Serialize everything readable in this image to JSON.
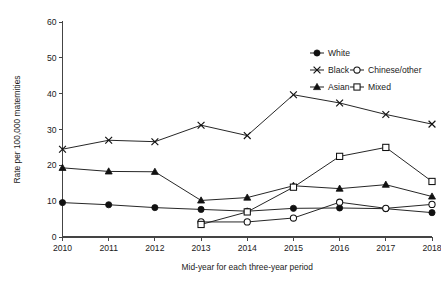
{
  "chart_data": {
    "type": "line",
    "title": "",
    "xlabel": "Mid-year for each three-year period",
    "ylabel": "Rate per 100,000 maternities",
    "x": [
      2010,
      2011,
      2012,
      2013,
      2014,
      2015,
      2016,
      2017,
      2018
    ],
    "xtick_labels": [
      "2010",
      "2011",
      "2012",
      "2013",
      "2014",
      "2015",
      "2016",
      "2017",
      "2018"
    ],
    "ytick_labels": [
      "0",
      "10",
      "20",
      "30",
      "40",
      "50",
      "60"
    ],
    "yticks": [
      0,
      10,
      20,
      30,
      40,
      50,
      60
    ],
    "ylim": [
      0,
      60
    ],
    "xlim": [
      2010,
      2018
    ],
    "grid": false,
    "legend_position": "upper-right",
    "series": [
      {
        "name": "White",
        "marker": "filled-circle",
        "color": "#111111",
        "x": [
          2010,
          2011,
          2012,
          2013,
          2014,
          2015,
          2016,
          2017,
          2018
        ],
        "values": [
          9.6,
          9.0,
          8.2,
          7.7,
          7.2,
          8.0,
          8.1,
          7.9,
          6.8
        ]
      },
      {
        "name": "Black",
        "marker": "cross",
        "color": "#111111",
        "x": [
          2010,
          2011,
          2012,
          2013,
          2014,
          2015,
          2016,
          2017,
          2018
        ],
        "values": [
          24.5,
          27.0,
          26.6,
          31.2,
          28.3,
          39.7,
          37.4,
          34.2,
          31.5
        ]
      },
      {
        "name": "Chinese/other",
        "marker": "open-circle",
        "color": "#111111",
        "x": [
          2013,
          2014,
          2015,
          2016,
          2017,
          2018
        ],
        "values": [
          4.2,
          4.2,
          5.3,
          9.7,
          8.0,
          9.1
        ]
      },
      {
        "name": "Asian",
        "marker": "filled-triangle",
        "color": "#111111",
        "x": [
          2010,
          2011,
          2012,
          2013,
          2014,
          2015,
          2016,
          2017,
          2018
        ],
        "values": [
          19.3,
          18.3,
          18.2,
          10.2,
          11.0,
          14.3,
          13.5,
          14.6,
          11.3
        ]
      },
      {
        "name": "Mixed",
        "marker": "open-square",
        "color": "#111111",
        "x": [
          2013,
          2014,
          2015,
          2016,
          2017,
          2018
        ],
        "values": [
          3.5,
          7.0,
          13.9,
          22.5,
          25.0,
          15.5
        ]
      }
    ],
    "legend": [
      {
        "label": "White",
        "marker": "filled-circle"
      },
      {
        "label": "Black",
        "marker": "cross"
      },
      {
        "label": "Chinese/other",
        "marker": "open-circle"
      },
      {
        "label": "Asian",
        "marker": "filled-triangle"
      },
      {
        "label": "Mixed",
        "marker": "open-square"
      }
    ]
  }
}
